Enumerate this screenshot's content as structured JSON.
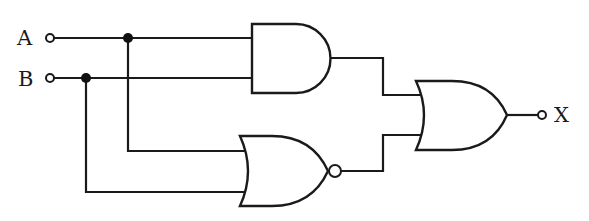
{
  "diagram": {
    "type": "logic-circuit",
    "inputs": [
      {
        "label": "A"
      },
      {
        "label": "B"
      }
    ],
    "output": {
      "label": "X"
    },
    "gates": [
      {
        "id": "g1",
        "type": "AND",
        "inputs": [
          "A",
          "B"
        ]
      },
      {
        "id": "g2",
        "type": "NOR",
        "inputs": [
          "A",
          "B"
        ]
      },
      {
        "id": "g3",
        "type": "OR",
        "inputs": [
          "g1",
          "g2"
        ],
        "output": "X"
      }
    ],
    "colors": {
      "line": "#1a1a1a",
      "background": "#ffffff"
    }
  }
}
